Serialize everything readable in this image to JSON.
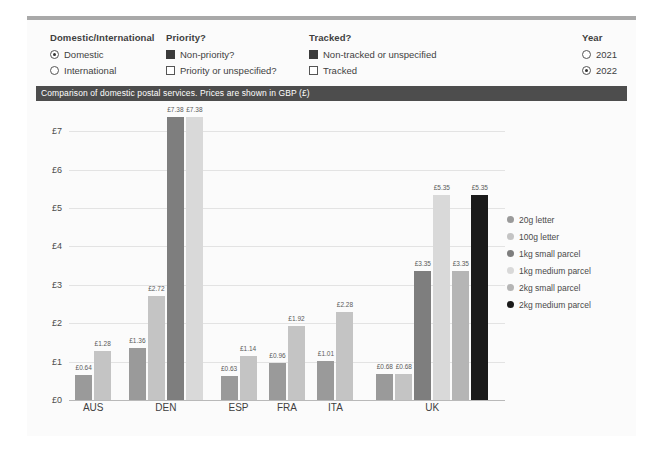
{
  "filters": [
    {
      "title": "Domestic/International",
      "control": "radio",
      "options": [
        {
          "label": "Domestic",
          "selected": true
        },
        {
          "label": "International",
          "selected": false
        }
      ]
    },
    {
      "title": "Priority?",
      "control": "checkbox",
      "options": [
        {
          "label": "Non-priority?",
          "selected": true
        },
        {
          "label": "Priority or unspecified?",
          "selected": false
        }
      ]
    },
    {
      "title": "Tracked?",
      "control": "checkbox",
      "options": [
        {
          "label": "Non-tracked or unspecified",
          "selected": true
        },
        {
          "label": "Tracked",
          "selected": false
        }
      ]
    },
    {
      "title": "Year",
      "control": "radio",
      "options": [
        {
          "label": "2021",
          "selected": false
        },
        {
          "label": "2022",
          "selected": true
        }
      ]
    }
  ],
  "chart_data": {
    "type": "bar",
    "title": "Comparison of domestic postal services. Prices are shown in GBP (£)",
    "xlabel": "",
    "ylabel": "",
    "ylim": [
      0,
      7.5
    ],
    "yticks": [
      "£0",
      "£1",
      "£2",
      "£3",
      "£4",
      "£5",
      "£6",
      "£7"
    ],
    "ytick_values": [
      0,
      1,
      2,
      3,
      4,
      5,
      6,
      7
    ],
    "grid": true,
    "legend_position": "right",
    "categories": [
      "AUS",
      "DEN",
      "ESP",
      "FRA",
      "ITA",
      "UK"
    ],
    "series": [
      {
        "name": "20g letter",
        "color": "#9a9a9a",
        "values": [
          0.64,
          1.36,
          0.63,
          0.96,
          1.01,
          0.68
        ]
      },
      {
        "name": "100g letter",
        "color": "#c4c4c4",
        "values": [
          1.28,
          2.72,
          1.14,
          1.92,
          2.28,
          0.68
        ]
      },
      {
        "name": "1kg small parcel",
        "color": "#7e7e7e",
        "values": [
          null,
          7.38,
          null,
          null,
          null,
          3.35
        ]
      },
      {
        "name": "1kg medium parcel",
        "color": "#d9d9d9",
        "values": [
          null,
          7.38,
          null,
          null,
          null,
          5.35
        ]
      },
      {
        "name": "2kg small parcel",
        "color": "#b5b5b5",
        "values": [
          null,
          null,
          null,
          null,
          null,
          3.35
        ]
      },
      {
        "name": "2kg medium parcel",
        "color": "#1a1a1a",
        "values": [
          null,
          null,
          null,
          null,
          null,
          5.35
        ]
      }
    ],
    "bar_labels": {
      "AUS": [
        "£0.64",
        "£1.28"
      ],
      "DEN": [
        "£1.36",
        "£2.72",
        "£7.38",
        "£7.38"
      ],
      "ESP": [
        "£0.63",
        "£1.14"
      ],
      "FRA": [
        "£0.96",
        "£1.92"
      ],
      "ITA": [
        "£1.01",
        "£2.28"
      ],
      "UK": [
        "£0.68",
        "£0.68",
        "£3.35",
        "£5.35",
        "£3.35",
        "£5.35"
      ]
    }
  },
  "colors": {
    "title_bar_bg": "#4d4d4d",
    "title_bar_text": "#ffffff",
    "panel_bg": "#fbfbfb",
    "grid_line": "#e3e3e3",
    "axis_line": "#b9b9b9"
  }
}
